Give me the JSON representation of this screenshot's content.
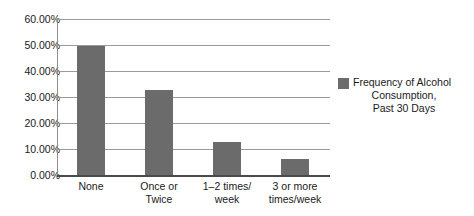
{
  "chart_data": {
    "type": "bar",
    "title": "",
    "xlabel": "",
    "ylabel": "",
    "categories": [
      "None",
      "Once or Twice",
      "1–2 times/ week",
      "3 or more times/week"
    ],
    "values": [
      49.5,
      32.8,
      12.8,
      6.0
    ],
    "ylim": [
      0,
      60
    ],
    "ytick_values": [
      60,
      50,
      40,
      30,
      20,
      10,
      0
    ],
    "ytick_labels": [
      "60.00%",
      "50.00%",
      "40.00%",
      "30.00%",
      "20.00%",
      "10.00%",
      "0.00%"
    ],
    "grid": true,
    "legend_position": "right",
    "series": [
      {
        "name": "Frequency of Alcohol Consumption, Past 30 Days",
        "color": "#6b6b6b",
        "values": [
          49.5,
          32.8,
          12.8,
          6.0
        ]
      }
    ]
  },
  "axis": {
    "ticks": [
      {
        "label": "60.00%"
      },
      {
        "label": "50.00%"
      },
      {
        "label": "40.00%"
      },
      {
        "label": "30.00%"
      },
      {
        "label": "20.00%"
      },
      {
        "label": "10.00%"
      },
      {
        "label": "0.00%"
      }
    ],
    "categories": [
      {
        "line1": "None",
        "line2": ""
      },
      {
        "line1": "Once or",
        "line2": "Twice"
      },
      {
        "line1": "1–2 times/",
        "line2": "week"
      },
      {
        "line1": "3 or more",
        "line2": "times/week"
      }
    ]
  },
  "legend": {
    "line1": "Frequency of Alcohol",
    "line2": "Consumption,",
    "line3": "Past 30 Days",
    "swatch_color": "#6b6b6b"
  },
  "colors": {
    "bar": "#6b6b6b",
    "gridline": "#9a9a9a",
    "axis": "#4a4a4a",
    "background": "#ffffff",
    "text": "#1a1a1a"
  }
}
